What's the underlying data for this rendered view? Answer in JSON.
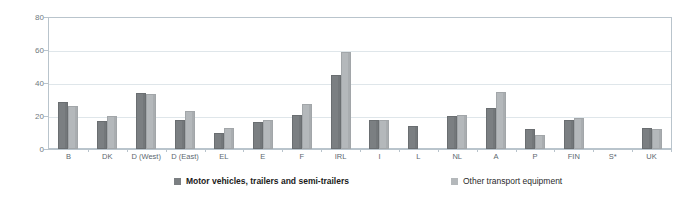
{
  "chart_data": {
    "type": "bar",
    "title": "",
    "subtitle": "",
    "xlabel": "",
    "ylabel": "",
    "ylim": [
      0,
      80
    ],
    "yticks": [
      0,
      20,
      40,
      60,
      80
    ],
    "grid": true,
    "legend_position": "bottom",
    "categories": [
      "B",
      "DK",
      "D (West)",
      "D (East)",
      "EL",
      "E",
      "F",
      "IRL",
      "I",
      "L",
      "NL",
      "A",
      "P",
      "FIN",
      "S*",
      "UK"
    ],
    "series": [
      {
        "name": "Motor vehicles, trailers and semi-trailers",
        "color": "#7b7f82",
        "values": [
          28.5,
          17,
          34,
          18,
          9.5,
          16.5,
          21,
          45,
          17.5,
          14,
          20,
          25,
          12,
          17.5,
          null,
          13
        ]
      },
      {
        "name": "Other transport equipment",
        "color": "#b4b8bb",
        "values": [
          26,
          20,
          33.5,
          23,
          13,
          17.5,
          27.5,
          59,
          17.5,
          null,
          20.5,
          35,
          8.5,
          19,
          null,
          12.5
        ]
      }
    ]
  },
  "axis": {
    "y_tick_labels": [
      "80",
      "60",
      "40",
      "20",
      "0"
    ]
  },
  "legend": {
    "entries": [
      {
        "label": "Motor vehicles, trailers and semi-trailers"
      },
      {
        "label": "Other transport equipment"
      }
    ]
  }
}
